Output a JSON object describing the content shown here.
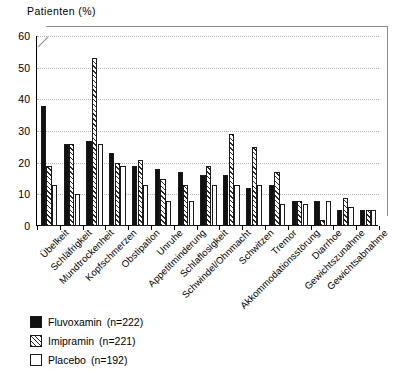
{
  "chart_data": {
    "type": "bar",
    "title": "",
    "ylabel": "Patienten (%)",
    "xlabel": "",
    "ylim": [
      0,
      60
    ],
    "yticks": [
      0,
      10,
      20,
      30,
      40,
      50,
      60
    ],
    "grid": true,
    "legend_position": "below-left",
    "categories": [
      "Übelkeit",
      "Schläfrigkeit",
      "Mundtrockenheit",
      "Kopfschmerzen",
      "Obstipation",
      "Unruhe",
      "Appetitminderung",
      "Schlaflosigkeit",
      "Schwindel/Ohnmacht",
      "Schwitzen",
      "Tremor",
      "Akkommodationsstörung",
      "Diarrhoe",
      "Gewichtszunahme",
      "Gewichtsabnahme"
    ],
    "series": [
      {
        "name": "Fluvoxamin",
        "n": 222,
        "legend_label": "Fluvoxamin",
        "legend_n": "(n=222)",
        "fill": "solid-black",
        "color": "#111111",
        "values": [
          38,
          26,
          27,
          23,
          19,
          18,
          17,
          16,
          16,
          12,
          13,
          8,
          8,
          5,
          5
        ]
      },
      {
        "name": "Imipramin",
        "n": 221,
        "legend_label": "Imipramin",
        "legend_n": "(n=221)",
        "fill": "diagonal-hatch",
        "color": "#2b2b2b",
        "values": [
          19,
          26,
          53,
          20,
          21,
          15,
          13,
          19,
          29,
          25,
          17,
          8,
          2,
          9,
          5
        ]
      },
      {
        "name": "Placebo",
        "n": 192,
        "legend_label": "Placebo",
        "legend_n": "(n=192)",
        "fill": "white",
        "color": "#ffffff",
        "values": [
          13,
          10,
          26,
          19,
          13,
          8,
          8,
          13,
          13,
          13,
          7,
          7,
          8,
          6,
          5
        ]
      }
    ]
  },
  "axis": {
    "y_title": "Patienten (%)"
  },
  "legend": {
    "entries": [
      {
        "label": "Fluvoxamin",
        "n": "(n=222)"
      },
      {
        "label": "Imipramin",
        "n": "(n=221)"
      },
      {
        "label": "Placebo",
        "n": "(n=192)"
      }
    ]
  }
}
